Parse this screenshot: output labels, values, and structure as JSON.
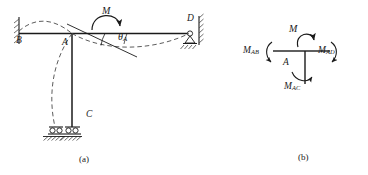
{
  "figure": {
    "stroke_color": "#1a1a1a",
    "dashed_color": "#4a4a4a",
    "background": "#ffffff"
  },
  "panel_a": {
    "caption": "(a)",
    "labels": {
      "node_b": "B",
      "node_a": "A",
      "node_c": "C",
      "node_d": "D",
      "moment": "M",
      "rotation_symbol": "θ",
      "rotation_subscript": "A"
    },
    "elements": [
      {
        "name": "fixed-support-b",
        "type": "fixed-support",
        "at": "B"
      },
      {
        "name": "beam-ba",
        "type": "member",
        "from": "B",
        "to": "A"
      },
      {
        "name": "beam-ad",
        "type": "member",
        "from": "A",
        "to": "D"
      },
      {
        "name": "column-ac",
        "type": "member",
        "from": "A",
        "to": "C"
      },
      {
        "name": "roller-support-c",
        "type": "rocker-support",
        "at": "C"
      },
      {
        "name": "pin-support-d",
        "type": "pin-support-wall",
        "at": "D"
      },
      {
        "name": "deflected-shape",
        "type": "dashed-curve"
      },
      {
        "name": "applied-moment",
        "type": "curved-arrow",
        "label": "M"
      },
      {
        "name": "rotation-angle",
        "type": "angle-arc",
        "label": "θA"
      }
    ]
  },
  "panel_b": {
    "caption": "(b)",
    "labels": {
      "joint": "A",
      "applied_moment": "M",
      "moment_ab_symbol": "M",
      "moment_ab_subscript": "AB",
      "moment_ad_symbol": "M",
      "moment_ad_subscript": "AD",
      "moment_ac_symbol": "M",
      "moment_ac_subscript": "AC"
    },
    "elements": [
      {
        "name": "joint-stub-left",
        "type": "member-stub"
      },
      {
        "name": "joint-stub-right",
        "type": "member-stub"
      },
      {
        "name": "joint-stub-down",
        "type": "member-stub"
      },
      {
        "name": "moment-arrow-applied",
        "type": "curved-arrow"
      },
      {
        "name": "moment-arrow-ab",
        "type": "curved-arrow"
      },
      {
        "name": "moment-arrow-ad",
        "type": "curved-arrow"
      },
      {
        "name": "moment-arrow-ac",
        "type": "curved-arrow"
      }
    ]
  }
}
